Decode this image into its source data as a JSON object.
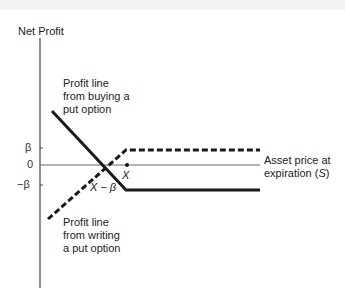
{
  "diagram": {
    "y_axis_label": "Net Profit",
    "x_axis_label_line1": "Asset price at",
    "x_axis_label_line2_prefix": "expiration (",
    "x_axis_label_var": "S",
    "x_axis_label_line2_suffix": ")",
    "ticks": {
      "beta": "β",
      "zero": "0",
      "neg_beta": "−β"
    },
    "points": {
      "strike": "X",
      "breakeven": "X − β"
    },
    "annotations": {
      "buy_put": [
        "Profit line",
        "from buying a",
        "put option"
      ],
      "write_put": [
        "Profit line",
        "from writing",
        "a put option"
      ]
    },
    "colors": {
      "line": "#1a1a1a",
      "axis": "#555555",
      "text": "#222222"
    }
  }
}
